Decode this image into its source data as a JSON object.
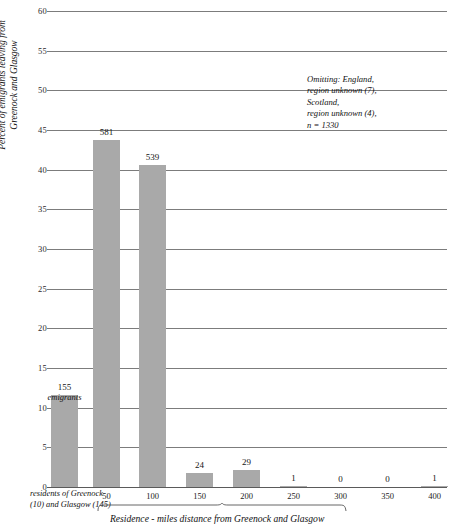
{
  "chart_data": {
    "type": "bar",
    "title": "",
    "ylabel": "Percent of emigrants leaving from Greenock and Glasgow",
    "xlabel": "Residence - miles distance from Greenock and Glasgow",
    "ylim": [
      0,
      60
    ],
    "yticks": [
      0,
      5,
      10,
      15,
      20,
      25,
      30,
      35,
      40,
      45,
      50,
      55,
      60
    ],
    "grid": true,
    "legend": "none",
    "categories": [
      "residents of Greenock and Glasgow",
      "50",
      "100",
      "150",
      "200",
      "250",
      "300",
      "350",
      "400"
    ],
    "xtick_labels": [
      "50",
      "100",
      "150",
      "200",
      "250",
      "300",
      "350",
      "400"
    ],
    "values": [
      11.65,
      43.68,
      40.53,
      1.8,
      2.18,
      0.08,
      0.0,
      0.0,
      0.08
    ],
    "counts": [
      155,
      581,
      539,
      24,
      29,
      1,
      0,
      0,
      1
    ],
    "count_labels": [
      "155",
      "581",
      "539",
      "24",
      "29",
      "1",
      "0",
      "0",
      "1"
    ],
    "first_bar_sublabel": "emigrants",
    "n": 1330
  },
  "yaxis": {
    "title": "Percent of emigrants leaving from Greenock and Glasgow",
    "ticks": [
      "60",
      "55",
      "50",
      "45",
      "40",
      "35",
      "30",
      "25",
      "20",
      "15",
      "10",
      "5",
      "0"
    ]
  },
  "xaxis": {
    "title": "Residence - miles distance from Greenock and Glasgow",
    "ticks": [
      "50",
      "100",
      "150",
      "200",
      "250",
      "300",
      "350",
      "400"
    ],
    "category_label": "residents of Greenock (10) and Glasgow (145)"
  },
  "annotation": {
    "lines": [
      "Omitting: England,",
      "region unknown (7),",
      "Scotland,",
      "region unknown (4),",
      "n = 1330"
    ]
  },
  "bars": [
    {
      "label": "155",
      "sublabel": "emigrants"
    },
    {
      "label": "581",
      "sublabel": ""
    },
    {
      "label": "539",
      "sublabel": ""
    },
    {
      "label": "24",
      "sublabel": ""
    },
    {
      "label": "29",
      "sublabel": ""
    },
    {
      "label": "1",
      "sublabel": ""
    },
    {
      "label": "0",
      "sublabel": ""
    },
    {
      "label": "0",
      "sublabel": ""
    },
    {
      "label": "1",
      "sublabel": ""
    }
  ],
  "colors": {
    "bar": "#a9a9a9",
    "grid": "#7c7c7c",
    "text": "#111111",
    "background": "#ffffff"
  }
}
